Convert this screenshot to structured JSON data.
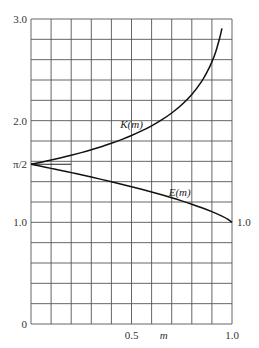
{
  "chart_data": {
    "type": "line",
    "title": "",
    "xlabel": "m",
    "ylabel": "",
    "xlim": [
      0,
      1.0
    ],
    "ylim": [
      0,
      3.0
    ],
    "grid": true,
    "grid_x_step": 0.1,
    "grid_y_step": 0.2,
    "x_ticks": [
      {
        "value": 0.5,
        "label": "0.5"
      },
      {
        "value": 1.0,
        "label": "1.0"
      }
    ],
    "y_ticks": [
      {
        "value": 0,
        "label": "0"
      },
      {
        "value": 1.0,
        "label": "1.0"
      },
      {
        "value": 1.5708,
        "label": "π/2"
      },
      {
        "value": 2.0,
        "label": "2.0"
      },
      {
        "value": 3.0,
        "label": "3.0"
      }
    ],
    "series": [
      {
        "name": "K(m)",
        "label": "K(m)",
        "x": [
          0,
          0.05,
          0.1,
          0.15,
          0.2,
          0.25,
          0.3,
          0.35,
          0.4,
          0.45,
          0.5,
          0.55,
          0.6,
          0.65,
          0.7,
          0.75,
          0.8,
          0.85,
          0.88,
          0.9,
          0.92,
          0.94,
          0.95
        ],
        "values": [
          1.5708,
          1.591,
          1.6124,
          1.635,
          1.6596,
          1.6858,
          1.7139,
          1.744,
          1.7775,
          1.8138,
          1.8541,
          1.8989,
          1.9496,
          2.0076,
          2.0754,
          2.1565,
          2.2572,
          2.389,
          2.494,
          2.5781,
          2.6836,
          2.8228,
          2.9083
        ]
      },
      {
        "name": "E(m)",
        "label": "E(m)",
        "x": [
          0,
          0.05,
          0.1,
          0.15,
          0.2,
          0.25,
          0.3,
          0.35,
          0.4,
          0.45,
          0.5,
          0.55,
          0.6,
          0.65,
          0.7,
          0.75,
          0.8,
          0.85,
          0.9,
          0.95,
          0.98,
          1.0
        ],
        "values": [
          1.5708,
          1.5507,
          1.5308,
          1.5108,
          1.489,
          1.4675,
          1.4454,
          1.4227,
          1.3994,
          1.3753,
          1.3506,
          1.325,
          1.2984,
          1.2705,
          1.2417,
          1.2111,
          1.1785,
          1.1434,
          1.1048,
          1.0605,
          1.0286,
          1.0
        ]
      }
    ],
    "annotations": [
      {
        "text": "K(m)",
        "x": 0.5,
        "y": 1.93
      },
      {
        "text": "E(m)",
        "x": 0.74,
        "y": 1.26
      },
      {
        "text": "1.0",
        "x": 1.0,
        "y": 1.0,
        "note": "end value of E(m) at right edge"
      }
    ],
    "reference_tick": {
      "from_x": 0,
      "to_x": 0.2,
      "y": 1.5708
    }
  }
}
